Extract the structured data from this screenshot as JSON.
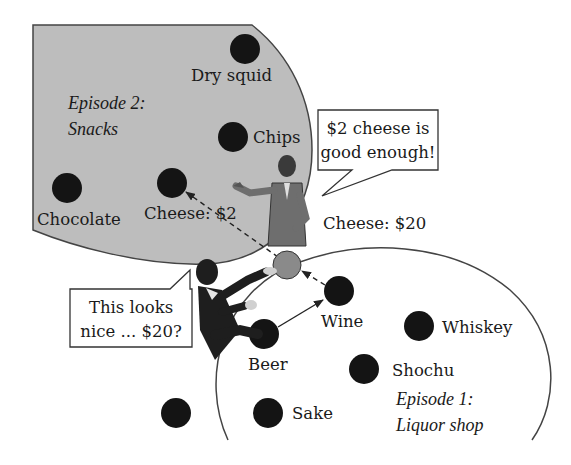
{
  "colors": {
    "region_fill": "#bdbdbd",
    "region_stroke": "#444444",
    "node_fill": "#141414",
    "current_node_fill": "#8a8a8a",
    "text": "#1a1a1a"
  },
  "episode2": {
    "title_line1": "Episode 2:",
    "title_line2": "Snacks",
    "nodes": {
      "dry_squid": "Dry squid",
      "chips": "Chips",
      "chocolate": "Chocolate",
      "cheese": "Cheese: $2"
    }
  },
  "episode1": {
    "title_line1": "Episode 1:",
    "title_line2": "Liquor shop",
    "nodes": {
      "wine": "Wine",
      "whiskey": "Whiskey",
      "beer": "Beer",
      "shochu": "Shochu",
      "sake": "Sake"
    }
  },
  "current_item": {
    "label": "Cheese: $20"
  },
  "bubbles": {
    "clerk_line1": "$2 cheese is",
    "clerk_line2": "good enough!",
    "customer_line1": "This looks",
    "customer_line2": "nice ... $20?"
  }
}
